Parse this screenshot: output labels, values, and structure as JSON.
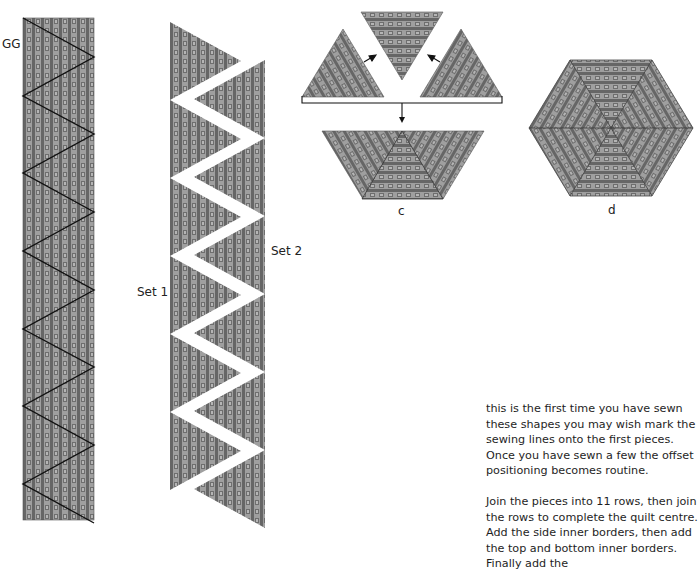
{
  "figure": {
    "labels": {
      "strip_gg": "GG",
      "set_1": "Set 1",
      "set_2": "Set 2",
      "panel_c": "c",
      "panel_d": "d"
    },
    "colors": {
      "fabric_light": "#a3a3a3",
      "fabric_dark": "#656565",
      "fabric_square": "#7d7d7d",
      "line": "#111111",
      "background": "#ffffff"
    },
    "panels": [
      {
        "id": "GG",
        "description": "Fabric strip marked with zig-zag cutting lines into triangles"
      },
      {
        "id": "sets",
        "description": "Strip cut into two sets of triangles, Set 1 and Set 2, separated by white zig-zag gap"
      },
      {
        "id": "c",
        "description": "Three triangles joined into a trapezoid half-hexagon"
      },
      {
        "id": "d",
        "description": "Six triangles forming a complete hexagon"
      }
    ]
  },
  "text": {
    "paragraphs": [
      "this is the first time you have sewn these shapes you may wish mark the sewing lines onto the first pieces. Once you have sewn a few the offset positioning becomes routine.",
      "Join the pieces into 11 rows, then join the rows to complete the quilt centre. Add the side inner borders, then add the top and bottom inner borders. Finally add the"
    ]
  }
}
